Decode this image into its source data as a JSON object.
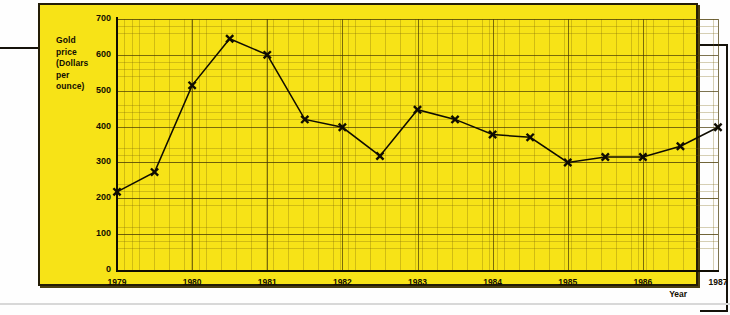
{
  "axis": {
    "y_label_lines": [
      "Gold",
      "price",
      "(Dollars",
      "per",
      "ounce)"
    ],
    "y_label_full": "Gold price (Dollars per ounce)",
    "x_title": "Year"
  },
  "colors": {
    "background": "#f7e317",
    "frame": "#241d06",
    "ink": "#0f0c02",
    "grid_major": "#463804",
    "grid_minor": "#786208"
  },
  "chart_data": {
    "type": "line",
    "title": "",
    "xlabel": "Year",
    "ylabel": "Gold price (Dollars per ounce)",
    "xlim": [
      1979,
      1987
    ],
    "ylim": [
      0,
      700
    ],
    "ytick_labels": [
      "0",
      "100",
      "200",
      "300",
      "400",
      "500",
      "600",
      "700"
    ],
    "yticks": [
      0,
      100,
      200,
      300,
      400,
      500,
      600,
      700
    ],
    "xtick_labels": [
      "1979",
      "1980",
      "1981",
      "1982",
      "1983",
      "1984",
      "1985",
      "1986",
      "1987"
    ],
    "xticks": [
      1979,
      1980,
      1981,
      1982,
      1983,
      1984,
      1985,
      1986,
      1987
    ],
    "grid": true,
    "minor_grid": true,
    "legend": false,
    "marker": "x",
    "series": [
      {
        "name": "Gold price",
        "x": [
          1979,
          1979.5,
          1980,
          1980.5,
          1981,
          1981.5,
          1982,
          1982.5,
          1983,
          1983.5,
          1984,
          1984.5,
          1985,
          1985.5,
          1986,
          1986.5,
          1987
        ],
        "values": [
          218,
          273,
          515,
          645,
          600,
          420,
          398,
          318,
          447,
          420,
          378,
          370,
          300,
          315,
          315,
          345,
          398
        ]
      }
    ]
  }
}
